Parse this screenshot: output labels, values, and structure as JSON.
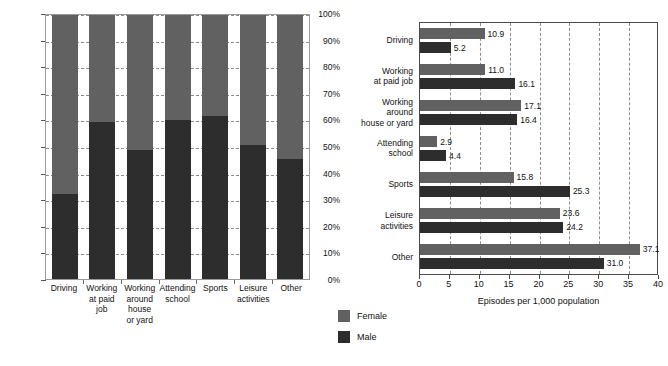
{
  "chart_data": [
    {
      "type": "bar",
      "subtype": "stacked-100-percent",
      "title": "",
      "xlabel": "",
      "ylabel": "",
      "ylim": [
        0,
        100
      ],
      "ytick_labels": [
        "0%",
        "10%",
        "20%",
        "30%",
        "40%",
        "50%",
        "60%",
        "70%",
        "80%",
        "90%",
        "100%"
      ],
      "grid": true,
      "categories": [
        "Driving",
        "Working at paid job",
        "Working around house or yard",
        "Attending school",
        "Sports",
        "Leisure activities",
        "Other"
      ],
      "category_label_lines": [
        [
          "Driving"
        ],
        [
          "Working",
          "at paid",
          "job"
        ],
        [
          "Working",
          "around",
          "house",
          "or yard"
        ],
        [
          "Attending",
          "school"
        ],
        [
          "Sports"
        ],
        [
          "Leisure",
          "activities"
        ],
        [
          "Other"
        ]
      ],
      "series": [
        {
          "name": "Male",
          "values": [
            32.3,
            59.4,
            49.0,
            60.3,
            61.6,
            50.6,
            45.5
          ]
        },
        {
          "name": "Female",
          "values": [
            67.7,
            40.6,
            51.0,
            39.7,
            38.4,
            49.4,
            54.5
          ]
        }
      ]
    },
    {
      "type": "bar",
      "subtype": "grouped-horizontal",
      "title": "",
      "xlabel": "Episodes per 1,000 population",
      "ylabel": "",
      "xlim": [
        0,
        40
      ],
      "xtick_labels": [
        "0",
        "5",
        "10",
        "15",
        "20",
        "25",
        "30",
        "35",
        "40"
      ],
      "grid": true,
      "categories": [
        "Driving",
        "Working at paid job",
        "Working around house or yard",
        "Attending school",
        "Sports",
        "Leisure activities",
        "Other"
      ],
      "category_label_lines": [
        [
          "Driving"
        ],
        [
          "Working",
          "at paid job"
        ],
        [
          "Working",
          "around",
          "house or yard"
        ],
        [
          "Attending",
          "school"
        ],
        [
          "Sports"
        ],
        [
          "Leisure",
          "activities"
        ],
        [
          "Other"
        ]
      ],
      "series": [
        {
          "name": "Female",
          "values": [
            10.9,
            11.0,
            17.1,
            2.9,
            15.8,
            23.6,
            37.1
          ]
        },
        {
          "name": "Male",
          "values": [
            5.2,
            16.1,
            16.4,
            4.4,
            25.3,
            24.2,
            31.0
          ]
        }
      ],
      "value_labels": {
        "female": [
          "10.9",
          "11.0",
          "17.1",
          "2.9",
          "15.8",
          "23.6",
          "37.1"
        ],
        "male": [
          "5.2",
          "16.1",
          "16.4",
          "4.4",
          "25.3",
          "24.2",
          "31.0"
        ]
      }
    }
  ],
  "legend": {
    "position": "bottom-center",
    "items": [
      {
        "label": "Female",
        "color": "#616161"
      },
      {
        "label": "Male",
        "color": "#2d2d2d"
      }
    ]
  },
  "colors": {
    "female": "#616161",
    "male": "#2d2d2d",
    "grid": "#8d8d8d",
    "axis": "#4a4a4a",
    "background": "#ffffff"
  }
}
